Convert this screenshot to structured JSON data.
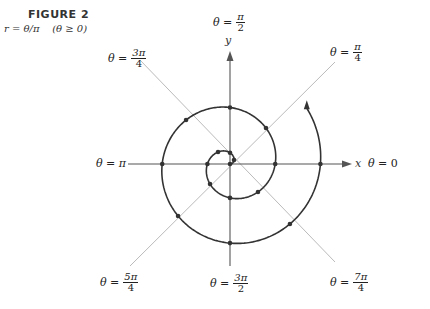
{
  "caption": {
    "title": "FIGURE 2",
    "subtitle": "r = θ/π    (θ ≥ 0)"
  },
  "axes": {
    "x_label": "x",
    "y_label": "y"
  },
  "ray_labels": {
    "zero": {
      "prefix": "θ =",
      "value": "0"
    },
    "pi_over_4": {
      "prefix": "θ =",
      "num": "π",
      "den": "4"
    },
    "pi_over_2": {
      "prefix": "θ =",
      "num": "π",
      "den": "2"
    },
    "three_pi_over_4": {
      "prefix": "θ =",
      "num": "3π",
      "den": "4"
    },
    "pi": {
      "prefix": "θ =",
      "value": "π"
    },
    "five_pi_over_4": {
      "prefix": "θ =",
      "num": "5π",
      "den": "4"
    },
    "three_pi_over_2": {
      "prefix": "θ =",
      "num": "3π",
      "den": "2"
    },
    "seven_pi_over_4": {
      "prefix": "θ =",
      "num": "7π",
      "den": "4"
    }
  },
  "chart_data": {
    "type": "polar-spiral",
    "title": "FIGURE 2",
    "equation": "r = θ/π",
    "domain": "θ ≥ 0",
    "theta_range": [
      0,
      4.2
    ],
    "theta_units": "π",
    "marked_points_theta_over_pi": [
      0,
      0.25,
      0.5,
      0.75,
      1,
      1.25,
      1.5,
      1.75,
      2,
      2.25,
      2.5,
      2.75,
      3,
      3.25,
      3.5,
      3.75,
      4
    ],
    "marked_points_r": [
      0,
      0.25,
      0.5,
      0.75,
      1,
      1.25,
      1.5,
      1.75,
      2,
      2.25,
      2.5,
      2.75,
      3,
      3.25,
      3.5,
      3.75,
      4
    ],
    "rays": [
      "0",
      "π/4",
      "π/2",
      "3π/4",
      "π",
      "5π/4",
      "3π/2",
      "7π/4"
    ],
    "xlabel": "x",
    "ylabel": "y",
    "grid": false
  },
  "style": {
    "curve_color": "#333333",
    "axis_color": "#555555",
    "ray_color": "#bbbbbb"
  }
}
